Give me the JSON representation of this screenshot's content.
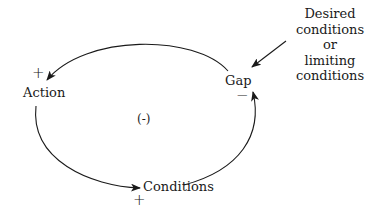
{
  "diagram": {
    "type": "causal-loop",
    "loop_polarity": "(-)",
    "nodes": {
      "action": {
        "label": "Action",
        "polarity": "+"
      },
      "conditions": {
        "label": "Conditions",
        "polarity": "+"
      },
      "gap": {
        "label": "Gap",
        "polarity": "−"
      }
    },
    "external_input": {
      "lines": [
        "Desired",
        "conditions",
        "or",
        "limiting",
        "conditions"
      ]
    },
    "edges": [
      {
        "from": "Gap",
        "to": "Action",
        "sign": "+"
      },
      {
        "from": "Action",
        "to": "Conditions",
        "sign": "+"
      },
      {
        "from": "Conditions",
        "to": "Gap",
        "sign": "−"
      },
      {
        "from": "Desired conditions or limiting conditions",
        "to": "Gap"
      }
    ],
    "colors": {
      "stroke": "#1a1a1a",
      "background": "#ffffff"
    }
  }
}
